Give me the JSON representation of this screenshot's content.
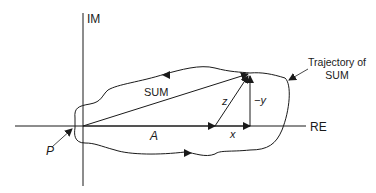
{
  "diagram": {
    "axes": {
      "vertical_label": "IM",
      "horizontal_label": "RE"
    },
    "labels": {
      "sum": "SUM",
      "a": "A",
      "x": "x",
      "z": "z",
      "neg_y": "−y",
      "p": "P",
      "trajectory_line1": "Trajectory of",
      "trajectory_line2": "SUM"
    },
    "colors": {
      "stroke": "#1a1a1a",
      "background": "#ffffff"
    }
  }
}
